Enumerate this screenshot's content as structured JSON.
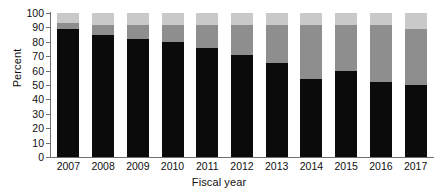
{
  "chart_data": {
    "type": "bar",
    "stacked": true,
    "title": "",
    "xlabel": "Fiscal year",
    "ylabel": "Percent",
    "categories": [
      "2007",
      "2008",
      "2009",
      "2010",
      "2011",
      "2012",
      "2013",
      "2014",
      "2015",
      "2016",
      "2017"
    ],
    "ylim": [
      0,
      100
    ],
    "yticks": [
      0,
      10,
      20,
      30,
      40,
      50,
      60,
      70,
      80,
      90,
      100
    ],
    "ytick_labels": [
      "0",
      "10",
      "20",
      "30",
      "40",
      "50",
      "60",
      "70",
      "80",
      "90",
      "100"
    ],
    "grid": false,
    "legend": "none",
    "series": [
      {
        "name": "segment-dark",
        "color": "#0b0b0b",
        "values": [
          89,
          85,
          82,
          80,
          76,
          71,
          65,
          54,
          60,
          52,
          50
        ]
      },
      {
        "name": "segment-medium",
        "color": "#8e8e8e",
        "values": [
          4,
          7,
          10,
          12,
          16,
          21,
          27,
          38,
          32,
          40,
          39
        ]
      },
      {
        "name": "segment-light",
        "color": "#c9c9c9",
        "values": [
          7,
          8,
          8,
          8,
          8,
          8,
          8,
          8,
          8,
          8,
          11
        ]
      }
    ]
  },
  "axes": {
    "ylabel": "Percent",
    "xlabel": "Fiscal year"
  }
}
